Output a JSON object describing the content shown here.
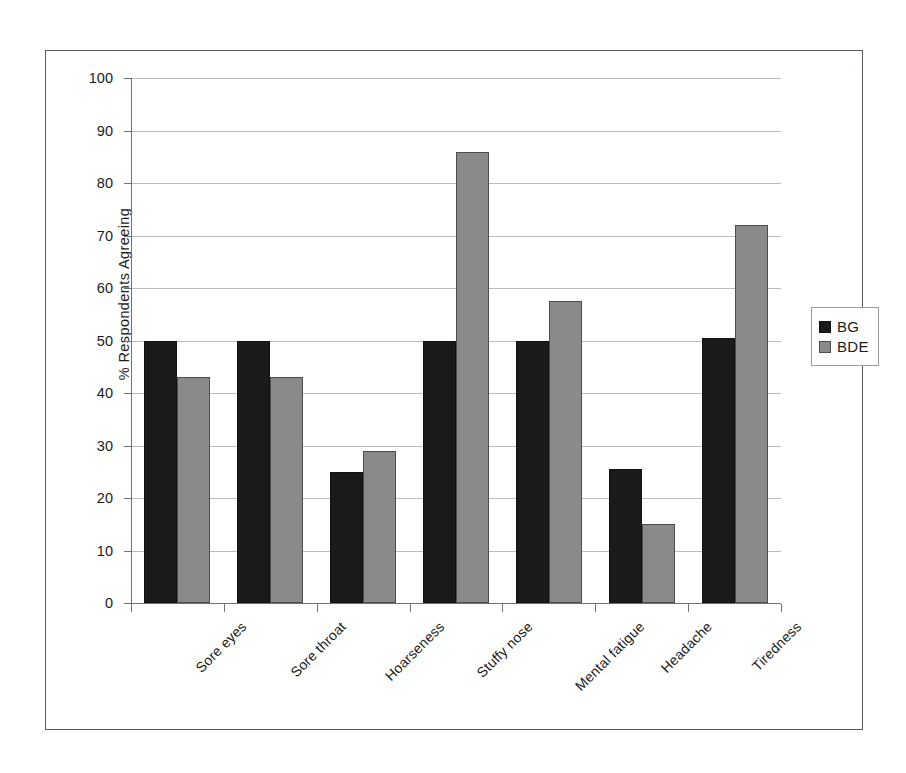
{
  "chart_data": {
    "type": "bar",
    "title": "",
    "xlabel": "",
    "ylabel": "% Respondents Agreeing",
    "ylim": [
      0,
      100
    ],
    "ytick_step": 10,
    "yticks": [
      100,
      90,
      80,
      70,
      60,
      50,
      40,
      30,
      20,
      10,
      0
    ],
    "grid": true,
    "legend_position": "right",
    "categories": [
      "Sore eyes",
      "Sore throat",
      "Hoarseness",
      "Stuffy nose",
      "Mental fatigue",
      "Headache",
      "Tiredness"
    ],
    "series": [
      {
        "name": "BG",
        "color": "#1a1a1a",
        "values": [
          50,
          50,
          25,
          50,
          50,
          25.5,
          50.5
        ]
      },
      {
        "name": "BDE",
        "color": "#8a8a8a",
        "values": [
          43,
          43,
          29,
          86,
          57.5,
          15,
          72
        ]
      }
    ]
  },
  "legend": {
    "entries": [
      {
        "label": "BG"
      },
      {
        "label": "BDE"
      }
    ]
  },
  "colors": {
    "series_bg": "#1a1a1a",
    "series_bde": "#8a8a8a",
    "gridline": "#b9bdbf",
    "axis": "#6d7275",
    "frame": "#555b5e",
    "text": "#1b1b1b",
    "background": "#ffffff"
  }
}
